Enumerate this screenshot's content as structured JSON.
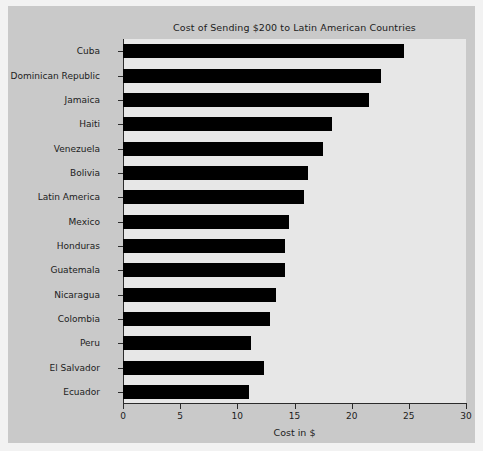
{
  "chart_data": {
    "type": "bar",
    "orientation": "horizontal",
    "title": "Cost of Sending $200 to Latin American Countries",
    "xlabel": "Cost in $",
    "ylabel": "",
    "xlim": [
      0,
      30
    ],
    "xticks": [
      "0",
      "5",
      "10",
      "15",
      "20",
      "25",
      "30"
    ],
    "grid": false,
    "legend": null,
    "bar_color": "#000000",
    "plot_background": "#e7e7e7",
    "figure_background": "#c9c9c9",
    "categories": [
      "Cuba",
      "Dominican Republic",
      "Jamaica",
      "Haiti",
      "Venezuela",
      "Bolivia",
      "Latin America",
      "Mexico",
      "Honduras",
      "Guatemala",
      "Nicaragua",
      "Colombia",
      "Peru",
      "El Salvador",
      "Ecuador"
    ],
    "values": [
      24.6,
      22.6,
      21.5,
      18.3,
      17.5,
      16.2,
      15.8,
      14.5,
      14.2,
      14.2,
      13.4,
      12.9,
      11.2,
      12.3,
      11.0
    ]
  }
}
